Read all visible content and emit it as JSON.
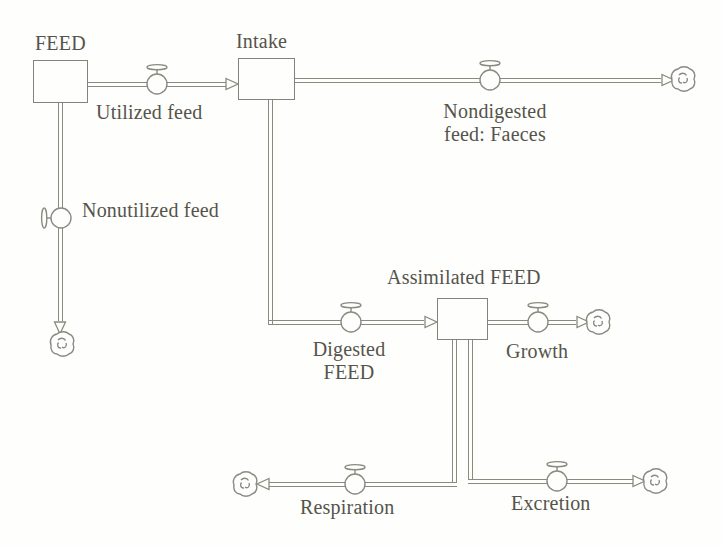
{
  "figure": {
    "type": "stock-and-flow diagram",
    "stocks": [
      {
        "label": "FEED"
      },
      {
        "label": "Intake"
      },
      {
        "label": "Assimilated FEED"
      }
    ],
    "flows": [
      {
        "label": "Utilized feed",
        "from": "FEED",
        "to": "Intake"
      },
      {
        "label": "Nondigested\nfeed: Faeces",
        "from": "Intake",
        "to": "sink-cloud"
      },
      {
        "label": "Nonutilized feed",
        "from": "FEED",
        "to": "sink-cloud"
      },
      {
        "label": "Digested\nFEED",
        "from": "Intake",
        "to": "Assimilated FEED"
      },
      {
        "label": "Growth",
        "from": "Assimilated FEED",
        "to": "sink-cloud"
      },
      {
        "label": "Respiration",
        "from": "Assimilated FEED",
        "to": "sink-cloud"
      },
      {
        "label": "Excretion",
        "from": "Assimilated FEED",
        "to": "sink-cloud"
      }
    ],
    "colors": {
      "line": "#8b8a7f",
      "text": "#55544b",
      "background": "#fefefd"
    }
  }
}
